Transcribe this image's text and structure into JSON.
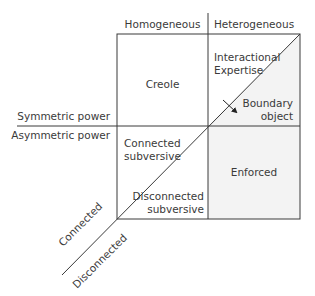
{
  "column_headers": {
    "left": "Homogeneous",
    "right": "Heterogeneous"
  },
  "row_headers": {
    "top": "Symmetric power",
    "bottom": "Asymmetric power"
  },
  "diagonal_labels": {
    "upper": "Connected",
    "lower": "Disconnected"
  },
  "cells": {
    "top_left": "Creole",
    "top_right_upper_line1": "Interactional",
    "top_right_upper_line2": "Expertise",
    "top_right_lower_line1": "Boundary",
    "top_right_lower_line2": "object",
    "bottom_left_upper_line1": "Connected",
    "bottom_left_upper_line2": "subversive",
    "bottom_left_lower_line1": "Disconnected",
    "bottom_left_lower_line2": "subversive",
    "bottom_right": "Enforced"
  },
  "colors": {
    "line": "#3a3a3a",
    "shade": "#f3f3f3",
    "text": "#3a3a3a"
  }
}
